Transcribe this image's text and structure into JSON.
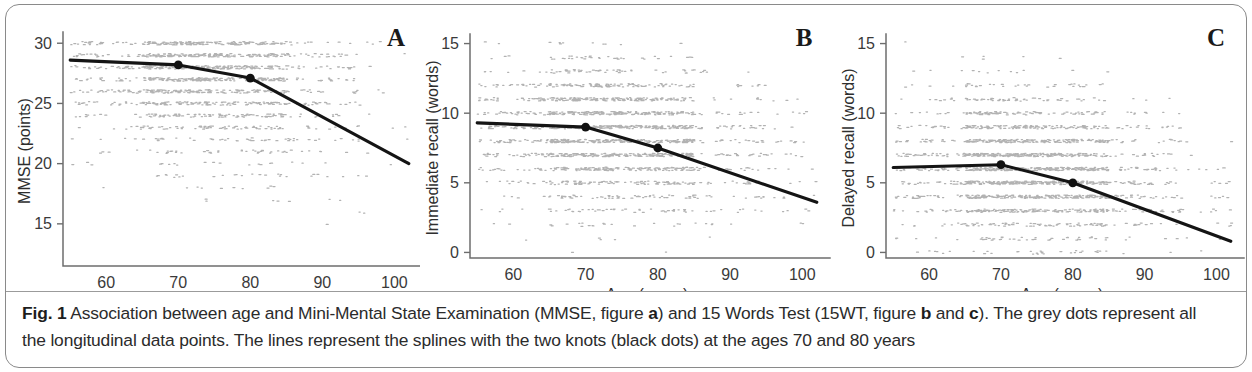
{
  "figure": {
    "label": "Fig. 1",
    "caption_parts": [
      {
        "text": "Association between age and Mini-Mental State Examination (MMSE, figure ",
        "bold": false
      },
      {
        "text": "a",
        "bold": true
      },
      {
        "text": ") and 15 Words Test (15WT, figure ",
        "bold": false
      },
      {
        "text": "b",
        "bold": true
      },
      {
        "text": " and ",
        "bold": false
      },
      {
        "text": "c",
        "bold": true
      },
      {
        "text": "). The grey dots represent all the longitudinal data points. The lines represent the splines with the two knots (black dots) at the ages 70 and 80 years",
        "bold": false
      }
    ],
    "caption_plain": "Fig. 1 Association between age and Mini-Mental State Examination (MMSE, figure a) and 15 Words Test (15WT, figure b and c). The grey dots represent all the longitudinal data points. The lines represent the splines with the two knots (black dots) at the ages 70 and 80 years"
  },
  "colors": {
    "scatter_grey": "#a7a7a7",
    "spline_black": "#141414",
    "axis_grey": "#6d6d6d",
    "frame_grey": "#8a8a8a"
  },
  "chart_data": [
    {
      "panel": "A",
      "type": "scatter",
      "title": "",
      "xlabel": "Age (years)",
      "ylabel": "MMSE (points)",
      "xlim": [
        54,
        103
      ],
      "ylim": [
        11.5,
        30.6
      ],
      "xticks": [
        60,
        70,
        80,
        90,
        100
      ],
      "yticks": [
        15,
        20,
        25,
        30
      ],
      "grid": false,
      "legend": null,
      "series": [
        {
          "name": "spline",
          "type": "line",
          "x": [
            55,
            70,
            80,
            102
          ],
          "values": [
            28.6,
            28.2,
            27.1,
            20.0
          ]
        },
        {
          "name": "knots",
          "type": "scatter",
          "x": [
            70,
            80
          ],
          "values": [
            28.2,
            27.1
          ]
        }
      ],
      "scatter_description": "dense grey longitudinal data points, banded at integer MMSE scores, densest between 26 and 30 and thinning below 20 at older ages",
      "scatter_bands": [
        30,
        29,
        28,
        27,
        26,
        25,
        24,
        23,
        22,
        21,
        20,
        19,
        18,
        17,
        16,
        15,
        14,
        13,
        12
      ],
      "scatter_band_weights": [
        0.95,
        0.95,
        0.92,
        0.88,
        0.8,
        0.68,
        0.55,
        0.45,
        0.36,
        0.3,
        0.26,
        0.2,
        0.16,
        0.13,
        0.1,
        0.08,
        0.06,
        0.04,
        0.03
      ]
    },
    {
      "panel": "B",
      "type": "scatter",
      "title": "",
      "xlabel": "Age (years)",
      "ylabel": "Immediate recall (words)",
      "xlim": [
        54,
        103
      ],
      "ylim": [
        -0.4,
        15.4
      ],
      "xticks": [
        60,
        70,
        80,
        90,
        100
      ],
      "yticks": [
        0,
        5,
        10,
        15
      ],
      "grid": false,
      "legend": null,
      "series": [
        {
          "name": "spline",
          "type": "line",
          "x": [
            55,
            70,
            80,
            102
          ],
          "values": [
            9.3,
            9.0,
            7.5,
            3.6
          ]
        },
        {
          "name": "knots",
          "type": "scatter",
          "x": [
            70,
            80
          ],
          "values": [
            9.0,
            7.5
          ]
        }
      ],
      "scatter_description": "dense grey longitudinal data points, banded at integer word counts, densest between 6 and 11",
      "scatter_bands": [
        15,
        14,
        13,
        12,
        11,
        10,
        9,
        8,
        7,
        6,
        5,
        4,
        3,
        2,
        1,
        0
      ],
      "scatter_band_weights": [
        0.2,
        0.3,
        0.42,
        0.6,
        0.82,
        0.95,
        0.98,
        0.95,
        0.9,
        0.8,
        0.62,
        0.42,
        0.26,
        0.15,
        0.09,
        0.06
      ]
    },
    {
      "panel": "C",
      "type": "scatter",
      "title": "",
      "xlabel": "Age (years)",
      "ylabel": "Delayed recall (words)",
      "xlim": [
        54,
        103
      ],
      "ylim": [
        -0.4,
        15.4
      ],
      "xticks": [
        60,
        70,
        80,
        90,
        100
      ],
      "yticks": [
        0,
        5,
        10,
        15
      ],
      "grid": false,
      "legend": null,
      "series": [
        {
          "name": "spline",
          "type": "line",
          "x": [
            55,
            70,
            80,
            102
          ],
          "values": [
            6.1,
            6.3,
            5.0,
            0.8
          ]
        },
        {
          "name": "knots",
          "type": "scatter",
          "x": [
            70,
            80
          ],
          "values": [
            6.3,
            5.0
          ]
        }
      ],
      "scatter_description": "dense grey longitudinal data points, banded at integer word counts, densest between 3 and 9",
      "scatter_bands": [
        15,
        14,
        13,
        12,
        11,
        10,
        9,
        8,
        7,
        6,
        5,
        4,
        3,
        2,
        1,
        0
      ],
      "scatter_band_weights": [
        0.06,
        0.1,
        0.18,
        0.3,
        0.45,
        0.62,
        0.8,
        0.92,
        0.97,
        0.98,
        0.95,
        0.88,
        0.74,
        0.5,
        0.3,
        0.2
      ]
    }
  ]
}
